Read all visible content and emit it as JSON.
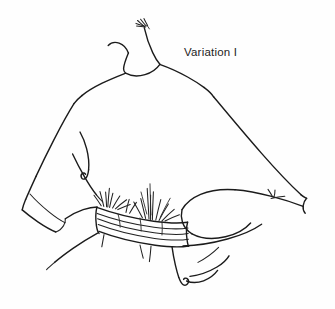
{
  "figure": {
    "kind": "fashion-technical-sketch",
    "title": "Variation I",
    "background_color": "#fefefe",
    "ink_color": "#1b1b1b",
    "width": 335,
    "height": 309,
    "caption": {
      "text": "Variation I",
      "x": 184,
      "y": 46,
      "font_size_px": 11.5,
      "color": "#232323"
    },
    "parts": [
      {
        "name": "neckline",
        "label": "Neckline"
      },
      {
        "name": "collar-hatching",
        "label": "Collar hatch marks"
      },
      {
        "name": "left-shoulder",
        "label": "Left shoulder"
      },
      {
        "name": "right-shoulder",
        "label": "Right shoulder"
      },
      {
        "name": "left-sleeve",
        "label": "Left dolman sleeve"
      },
      {
        "name": "left-cuff",
        "label": "Left cuff"
      },
      {
        "name": "right-sleeve",
        "label": "Right dolman sleeve"
      },
      {
        "name": "right-cuff",
        "label": "Right cuff point"
      },
      {
        "name": "bodice-drape",
        "label": "Bodice drape fold"
      },
      {
        "name": "waistband",
        "label": "Gathered elastic waistband"
      },
      {
        "name": "gathers",
        "label": "Gather radiating lines"
      },
      {
        "name": "hem-skirt",
        "label": "Lower hem / skirt edge"
      }
    ]
  }
}
